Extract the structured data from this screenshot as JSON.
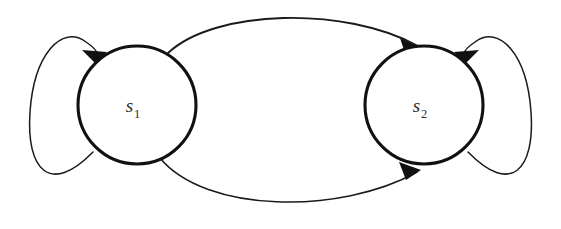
{
  "figure": {
    "type": "state-transition-diagram",
    "background_color": "#ffffff",
    "stroke_color": "#1a1a1a",
    "label_color": "#2b2b2b",
    "width": 561,
    "height": 229
  },
  "states": [
    {
      "id": "s1",
      "label_base": "s",
      "label_subscript": "1",
      "cx": 137,
      "cy": 105,
      "r": 59,
      "stroke_width": 3.1
    },
    {
      "id": "s2",
      "label_base": "s",
      "label_subscript": "2",
      "cx": 424,
      "cy": 105,
      "r": 59,
      "stroke_width": 3.1
    }
  ],
  "transitions": [
    {
      "id": "s1-self-loop",
      "from": "s1",
      "to": "s1",
      "kind": "self-loop",
      "side": "left",
      "stroke_width": 1.5,
      "path": "M 93 152 C 50 196, 26 170, 30 112 C 34 54, 62 24, 86 42 C 101 52, 99 58, 96 63",
      "arrow_points": "96,64 82,50 107,52",
      "arrow_rotation": 0
    },
    {
      "id": "s2-self-loop",
      "from": "s2",
      "to": "s2",
      "kind": "self-loop",
      "side": "right",
      "stroke_width": 1.5,
      "path": "M 468 152 C 511 196, 535 170, 531 112 C 527 54, 499 24, 475 42 C 460 52, 462 58, 465 63",
      "arrow_points": "465,64 479,50 454,52",
      "arrow_rotation": 0
    },
    {
      "id": "s1-to-s2-top",
      "from": "s1",
      "to": "s2",
      "kind": "arc",
      "side": "top",
      "stroke_width": 1.9,
      "path": "M 168 53 C 215 9, 345 6, 418 46",
      "arrow_points": "422,48 400,38 406,56"
    },
    {
      "id": "s1-to-s2-bottom",
      "from": "s1",
      "to": "s2",
      "kind": "arc",
      "side": "bottom",
      "stroke_width": 1.6,
      "path": "M 160 158 C 205 213, 340 215, 417 172",
      "arrow_points": "421,170 399,162 406,180"
    }
  ]
}
